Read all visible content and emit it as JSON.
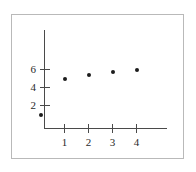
{
  "figure": {
    "background_color": "#ffffff",
    "frame_color": "#b9b9b9",
    "axis_color": "#4a4a4a",
    "marker_color": "#1c1c1c"
  },
  "chart_data": {
    "type": "scatter",
    "title": "",
    "subtitle": "",
    "xlabel": "",
    "ylabel": "",
    "x": [
      0,
      1,
      2,
      3,
      4
    ],
    "y": [
      0.9,
      5.0,
      5.35,
      5.7,
      5.9
    ],
    "series": [
      {
        "name": "",
        "points": [
          {
            "x": 0,
            "y": 0.9
          },
          {
            "x": 1,
            "y": 5.0
          },
          {
            "x": 2,
            "y": 5.35
          },
          {
            "x": 3,
            "y": 5.7
          },
          {
            "x": 4,
            "y": 5.9
          }
        ]
      }
    ],
    "xlim": [
      -0.35,
      5.1
    ],
    "ylim": [
      -0.6,
      8.0
    ],
    "xticks": [
      1,
      2,
      3,
      4
    ],
    "xticklabels": [
      "1",
      "2",
      "3",
      "4"
    ],
    "yticks": [
      2,
      4,
      6
    ],
    "yticklabels": [
      "2",
      "4",
      "6"
    ],
    "grid": false,
    "legend": null,
    "legend_position": "none",
    "annotations": [],
    "marker": "filled-circle",
    "axis_style": "left-and-bottom-spines"
  }
}
